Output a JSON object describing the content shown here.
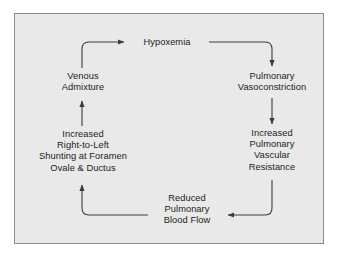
{
  "figure": {
    "background_color": "#ffffff",
    "panel_color": "#e9e9e9",
    "border_color": "#8c8c8c",
    "line_color": "#3c3c3c",
    "text_color": "#1c1c1c"
  },
  "nodes": [
    {
      "id": "hypoxemia",
      "lines": [
        "Hypoxemia"
      ],
      "position": "top-center"
    },
    {
      "id": "pulmonary-vasoconstriction",
      "lines": [
        "Pulmonary",
        "Vasoconstriction"
      ],
      "position": "right-upper"
    },
    {
      "id": "increased-pvr",
      "lines": [
        "Increased",
        "Pulmonary",
        "Vascular",
        "Resistance"
      ],
      "position": "right-lower"
    },
    {
      "id": "reduced-pulmonary-blood-flow",
      "lines": [
        "Reduced",
        "Pulmonary",
        "Blood Flow"
      ],
      "position": "bottom-center"
    },
    {
      "id": "increased-shunting",
      "lines": [
        "Increased",
        "Right-to-Left",
        "Shunting at Foramen",
        "Ovale & Ductus"
      ],
      "position": "left-lower"
    },
    {
      "id": "venous-admixture",
      "lines": [
        "Venous",
        "Admixture"
      ],
      "position": "left-upper"
    }
  ],
  "edges": [
    {
      "id": "edge-venous-to-hypoxemia",
      "from": "venous-admixture",
      "to": "hypoxemia",
      "arrowhead": "right"
    },
    {
      "id": "edge-hypoxemia-to-vasoconstriction",
      "from": "hypoxemia",
      "to": "pulmonary-vasoconstriction",
      "arrowhead": "down"
    },
    {
      "id": "edge-vasoconstriction-to-pvr",
      "from": "pulmonary-vasoconstriction",
      "to": "increased-pvr",
      "arrowhead": "down"
    },
    {
      "id": "edge-pvr-to-blood-flow",
      "from": "increased-pvr",
      "to": "reduced-pulmonary-blood-flow",
      "arrowhead": "left"
    },
    {
      "id": "edge-blood-flow-to-shunting",
      "from": "reduced-pulmonary-blood-flow",
      "to": "increased-shunting",
      "arrowhead": "up"
    },
    {
      "id": "edge-shunting-to-venous",
      "from": "increased-shunting",
      "to": "venous-admixture",
      "arrowhead": "up"
    }
  ]
}
